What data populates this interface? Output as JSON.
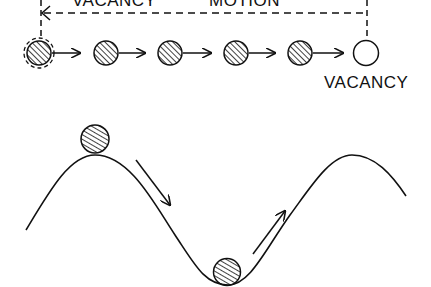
{
  "diagram": {
    "top_label_left": "VACANCY",
    "top_label_right": "MOTION",
    "vacancy_label": "VACANCY",
    "chain": {
      "atoms": 5,
      "vacancy_count": 1,
      "first_atom_dashed_outline": true
    },
    "energy_curve": {
      "description": "sinusoidal potential energy landscape",
      "ball_at_peak": true,
      "ball_at_trough": true,
      "arrows": [
        "downhill",
        "uphill"
      ]
    },
    "colors": {
      "ink": "#111111",
      "background": "#ffffff"
    }
  }
}
